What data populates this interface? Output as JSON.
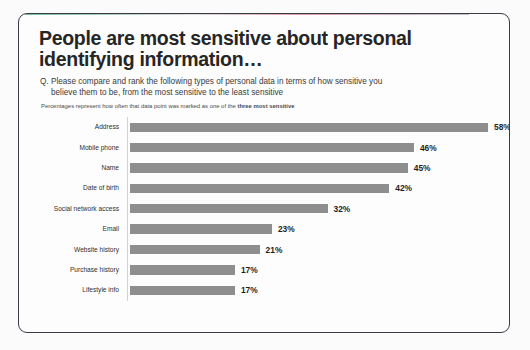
{
  "slide": {
    "headline": "People are most sensitive about personal identifying information…",
    "question_line1": "Q. Please compare and rank the following types of personal data in terms of how sensitive you",
    "question_line2": "believe them to be, from the most sensitive to the least sensitive",
    "footnote_prefix": "Percentages represent how often that data point was marked as one of the ",
    "footnote_emphasis": "three  most sensitive"
  },
  "chart_data": {
    "type": "bar",
    "orientation": "horizontal",
    "title": "People are most sensitive about personal identifying information…",
    "subtitle": "Q. Please compare and rank the following types of personal data in terms of how sensitive you believe them to be, from the most sensitive to the least sensitive",
    "annotation": "Percentages represent how often that data point was marked as one of the three most sensitive",
    "xlabel": "",
    "ylabel": "",
    "xlim": [
      0,
      58
    ],
    "grid": false,
    "legend": false,
    "bar_color": "#8e8e8e",
    "value_suffix": "%",
    "categories": [
      "Address",
      "Mobile phone",
      "Name",
      "Date of birth",
      "Social network access",
      "Email",
      "Website history",
      "Purchase history",
      "Lifestyle info"
    ],
    "values": [
      58,
      46,
      45,
      42,
      32,
      23,
      21,
      17,
      17
    ],
    "value_labels": [
      "58%",
      "46%",
      "45%",
      "42%",
      "32%",
      "23%",
      "21%",
      "17%",
      "17%"
    ]
  },
  "bleed_through": [
    "of the serve on what of reference",
    "the noted on the names record",
    "a common to the trace of the",
    "and the more so that and dos",
    "in one to the market and more",
    "on the records to so was a",
    "a tree to the more so and of",
    "the cost of the names to one"
  ]
}
